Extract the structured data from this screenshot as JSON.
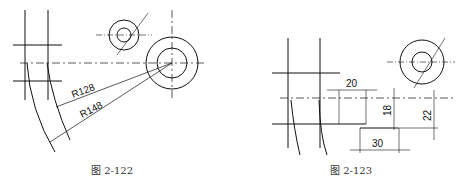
{
  "figures": [
    {
      "caption": "图 2-122",
      "dimensions": [
        "R128",
        "R148"
      ]
    },
    {
      "caption": "图 2-123",
      "dimensions": [
        "20",
        "18",
        "22",
        "30"
      ]
    }
  ],
  "colors": {
    "line": "#111111",
    "background": "#ffffff"
  }
}
